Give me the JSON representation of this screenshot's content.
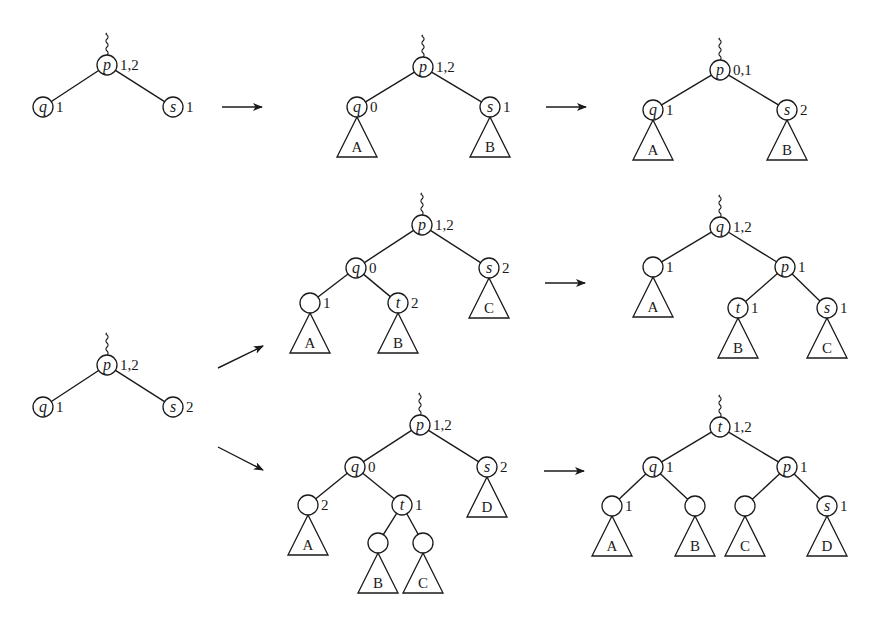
{
  "colors": {
    "ink": "#1a1a1a",
    "background": "#ffffff"
  },
  "node_radius": 10,
  "panels": [
    {
      "id": "row1-start",
      "nodes": [
        {
          "id": "p",
          "label": "p",
          "x": 107,
          "y": 65,
          "balance": "1,2",
          "parent_link": true
        },
        {
          "id": "q",
          "label": "q",
          "x": 43,
          "y": 107,
          "balance": "1"
        },
        {
          "id": "s",
          "label": "s",
          "x": 173,
          "y": 107,
          "balance": "1"
        }
      ],
      "edges": [
        [
          "p",
          "q"
        ],
        [
          "p",
          "s"
        ]
      ],
      "subtrees": []
    },
    {
      "id": "row1-mid",
      "nodes": [
        {
          "id": "p",
          "label": "p",
          "x": 423,
          "y": 67,
          "balance": "1,2",
          "parent_link": true
        },
        {
          "id": "q",
          "label": "q",
          "x": 357,
          "y": 107,
          "balance": "0"
        },
        {
          "id": "s",
          "label": "s",
          "x": 490,
          "y": 107,
          "balance": "1"
        }
      ],
      "edges": [
        [
          "p",
          "q"
        ],
        [
          "p",
          "s"
        ]
      ],
      "subtrees": [
        {
          "label": "A",
          "apex": "q"
        },
        {
          "label": "B",
          "apex": "s"
        }
      ]
    },
    {
      "id": "row1-end",
      "nodes": [
        {
          "id": "p",
          "label": "p",
          "x": 720,
          "y": 70,
          "balance": "0,1",
          "parent_link": true
        },
        {
          "id": "q",
          "label": "q",
          "x": 653,
          "y": 110,
          "balance": "1"
        },
        {
          "id": "s",
          "label": "s",
          "x": 787,
          "y": 110,
          "balance": "2"
        }
      ],
      "edges": [
        [
          "p",
          "q"
        ],
        [
          "p",
          "s"
        ]
      ],
      "subtrees": [
        {
          "label": "A",
          "apex": "q"
        },
        {
          "label": "B",
          "apex": "s"
        }
      ]
    },
    {
      "id": "row2-start",
      "nodes": [
        {
          "id": "p",
          "label": "p",
          "x": 107,
          "y": 365,
          "balance": "1,2",
          "parent_link": true
        },
        {
          "id": "q",
          "label": "q",
          "x": 43,
          "y": 407,
          "balance": "1"
        },
        {
          "id": "s",
          "label": "s",
          "x": 173,
          "y": 407,
          "balance": "2"
        }
      ],
      "edges": [
        [
          "p",
          "q"
        ],
        [
          "p",
          "s"
        ]
      ],
      "subtrees": []
    },
    {
      "id": "row2-case1-mid",
      "nodes": [
        {
          "id": "p",
          "label": "p",
          "x": 422,
          "y": 225,
          "balance": "1,2",
          "parent_link": true
        },
        {
          "id": "q",
          "label": "q",
          "x": 356,
          "y": 268,
          "balance": "0"
        },
        {
          "id": "s",
          "label": "s",
          "x": 489,
          "y": 268,
          "balance": "2"
        },
        {
          "id": "l",
          "label": "",
          "x": 310,
          "y": 303,
          "balance": "1"
        },
        {
          "id": "t",
          "label": "t",
          "x": 398,
          "y": 303,
          "balance": "2"
        }
      ],
      "edges": [
        [
          "p",
          "q"
        ],
        [
          "p",
          "s"
        ],
        [
          "q",
          "l"
        ],
        [
          "q",
          "t"
        ]
      ],
      "subtrees": [
        {
          "label": "A",
          "apex": "l"
        },
        {
          "label": "B",
          "apex": "t"
        },
        {
          "label": "C",
          "apex": "s"
        }
      ]
    },
    {
      "id": "row2-case1-end",
      "nodes": [
        {
          "id": "q",
          "label": "q",
          "x": 720,
          "y": 227,
          "balance": "1,2",
          "parent_link": true
        },
        {
          "id": "l",
          "label": "",
          "x": 653,
          "y": 267,
          "balance": "1"
        },
        {
          "id": "p",
          "label": "p",
          "x": 785,
          "y": 267,
          "balance": "1"
        },
        {
          "id": "t",
          "label": "t",
          "x": 738,
          "y": 308,
          "balance": "1"
        },
        {
          "id": "s",
          "label": "s",
          "x": 827,
          "y": 308,
          "balance": "1"
        }
      ],
      "edges": [
        [
          "q",
          "l"
        ],
        [
          "q",
          "p"
        ],
        [
          "p",
          "t"
        ],
        [
          "p",
          "s"
        ]
      ],
      "subtrees": [
        {
          "label": "A",
          "apex": "l"
        },
        {
          "label": "B",
          "apex": "t"
        },
        {
          "label": "C",
          "apex": "s"
        }
      ]
    },
    {
      "id": "row2-case2-mid",
      "nodes": [
        {
          "id": "p",
          "label": "p",
          "x": 420,
          "y": 425,
          "balance": "1,2",
          "parent_link": true
        },
        {
          "id": "q",
          "label": "q",
          "x": 355,
          "y": 467,
          "balance": "0"
        },
        {
          "id": "s",
          "label": "s",
          "x": 487,
          "y": 467,
          "balance": "2"
        },
        {
          "id": "l",
          "label": "",
          "x": 308,
          "y": 505,
          "balance": "2"
        },
        {
          "id": "t",
          "label": "t",
          "x": 402,
          "y": 505,
          "balance": "1"
        },
        {
          "id": "tl",
          "label": "",
          "x": 378,
          "y": 543,
          "balance": ""
        },
        {
          "id": "tr",
          "label": "",
          "x": 423,
          "y": 543,
          "balance": ""
        }
      ],
      "edges": [
        [
          "p",
          "q"
        ],
        [
          "p",
          "s"
        ],
        [
          "q",
          "l"
        ],
        [
          "q",
          "t"
        ],
        [
          "t",
          "tl"
        ],
        [
          "t",
          "tr"
        ]
      ],
      "subtrees": [
        {
          "label": "A",
          "apex": "l"
        },
        {
          "label": "B",
          "apex": "tl"
        },
        {
          "label": "C",
          "apex": "tr"
        },
        {
          "label": "D",
          "apex": "s"
        }
      ]
    },
    {
      "id": "row2-case2-end",
      "nodes": [
        {
          "id": "t",
          "label": "t",
          "x": 720,
          "y": 427,
          "balance": "1,2",
          "parent_link": true
        },
        {
          "id": "q",
          "label": "q",
          "x": 653,
          "y": 467,
          "balance": "1"
        },
        {
          "id": "p",
          "label": "p",
          "x": 787,
          "y": 467,
          "balance": "1"
        },
        {
          "id": "a",
          "label": "",
          "x": 612,
          "y": 506,
          "balance": "1"
        },
        {
          "id": "b",
          "label": "",
          "x": 695,
          "y": 506,
          "balance": ""
        },
        {
          "id": "c",
          "label": "",
          "x": 745,
          "y": 506,
          "balance": ""
        },
        {
          "id": "s",
          "label": "s",
          "x": 827,
          "y": 506,
          "balance": "1"
        }
      ],
      "edges": [
        [
          "t",
          "q"
        ],
        [
          "t",
          "p"
        ],
        [
          "q",
          "a"
        ],
        [
          "q",
          "b"
        ],
        [
          "p",
          "c"
        ],
        [
          "p",
          "s"
        ]
      ],
      "subtrees": [
        {
          "label": "A",
          "apex": "a"
        },
        {
          "label": "B",
          "apex": "b"
        },
        {
          "label": "C",
          "apex": "c"
        },
        {
          "label": "D",
          "apex": "s"
        }
      ]
    }
  ],
  "arrows": [
    {
      "from": [
        222,
        107
      ],
      "to": [
        262,
        107
      ]
    },
    {
      "from": [
        546,
        107
      ],
      "to": [
        586,
        107
      ]
    },
    {
      "from": [
        218,
        368
      ],
      "to": [
        263,
        346
      ]
    },
    {
      "from": [
        218,
        447
      ],
      "to": [
        263,
        470
      ]
    },
    {
      "from": [
        545,
        283
      ],
      "to": [
        585,
        283
      ]
    },
    {
      "from": [
        544,
        471
      ],
      "to": [
        584,
        471
      ]
    }
  ],
  "subtree_shape": {
    "height": 40,
    "half_base": 20
  }
}
